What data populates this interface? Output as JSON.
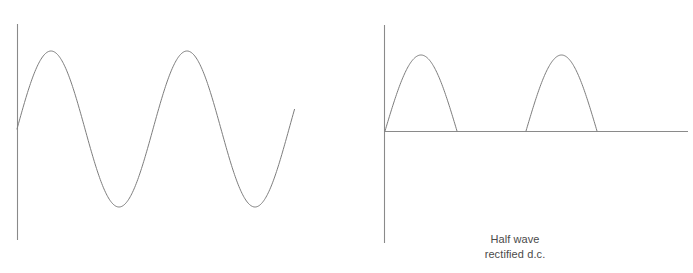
{
  "figure": {
    "title": "",
    "background_color": "#ffffff",
    "stroke_color": "#7d7d7d",
    "text_color": "#4a4a4a",
    "width": 693,
    "height": 273
  },
  "caption": {
    "line1": "Half wave",
    "line2": "rectified d.c."
  },
  "chart_data": [
    {
      "type": "line",
      "name": "alternating-current-waveform",
      "title": "",
      "xlabel": "",
      "ylabel": "",
      "grid": false,
      "legend": null,
      "axes": {
        "vertical_axis": {
          "x": 17,
          "y_top": 24,
          "y_bottom": 240
        },
        "horizontal_axis": null,
        "zero_level_y": 129
      },
      "waveform": "sine",
      "cycles": 2.05,
      "amplitude_px": 78,
      "period_px": 136,
      "phase": 0,
      "x_start": 17,
      "x_end": 295,
      "peaks_x": [
        58,
        193
      ],
      "peaks_y": 53,
      "troughs_x": [
        122,
        258
      ],
      "troughs_y": 210,
      "x": [
        17,
        30,
        45,
        58,
        72,
        88,
        105,
        122,
        140,
        158,
        175,
        193,
        208,
        225,
        242,
        258,
        275,
        295
      ],
      "values": [
        0,
        0.56,
        0.95,
        1.0,
        0.9,
        0.5,
        -0.1,
        -1.0,
        -0.72,
        -0.2,
        0.55,
        1.0,
        0.88,
        0.42,
        -0.38,
        -1.0,
        -0.68,
        -0.08
      ]
    },
    {
      "type": "line",
      "name": "half-wave-rectified-dc-waveform",
      "title": "Half wave rectified d.c.",
      "xlabel": "",
      "ylabel": "",
      "grid": false,
      "legend": null,
      "axes": {
        "vertical_axis": {
          "x": 384,
          "y_top": 25,
          "y_bottom": 243
        },
        "horizontal_axis": {
          "y": 131,
          "x_start": 384,
          "x_end": 688
        },
        "zero_level_y": 131
      },
      "waveform": "half-wave-rectified-sine",
      "amplitude_px": 76,
      "period_px": 141,
      "humps": [
        {
          "x_start": 385,
          "x_peak": 416,
          "x_end": 457,
          "y_peak": 55
        },
        {
          "x_start": 526,
          "x_peak": 557,
          "x_end": 597,
          "y_peak": 55
        }
      ],
      "flat_segments": [
        {
          "x_start": 457,
          "x_end": 526
        },
        {
          "x_start": 597,
          "x_end": 688
        }
      ]
    }
  ]
}
